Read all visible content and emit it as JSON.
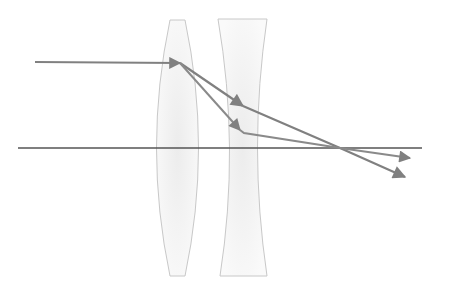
{
  "diagram": {
    "title": "",
    "type": "ray-optics",
    "colors": {
      "background": "#ffffff",
      "axis": "#555555",
      "ray": "#808080",
      "lens_outline": "#c8c8c8",
      "lens_fill": "#f2f2f2"
    },
    "elements": {
      "optical_axis": {
        "label": "optical axis",
        "x1": 18,
        "y1": 148,
        "x2": 422,
        "y2": 148
      },
      "convex_lens": {
        "label": "converging lens"
      },
      "concave_lens": {
        "label": "diverging lens"
      },
      "incoming_ray": {
        "label": "incident ray",
        "x1": 35,
        "y1": 62,
        "x2": 180,
        "y2": 63
      },
      "ray_with_diverging": {
        "label": "ray through both lenses",
        "points": [
          [
            180,
            63
          ],
          [
            243,
            106
          ],
          [
            340,
            148
          ],
          [
            405,
            177
          ]
        ]
      },
      "ray_without_diverging": {
        "label": "ray through converging lens only",
        "points": [
          [
            180,
            63
          ],
          [
            243,
            132
          ],
          [
            340,
            148
          ],
          [
            410,
            158
          ]
        ]
      }
    }
  }
}
